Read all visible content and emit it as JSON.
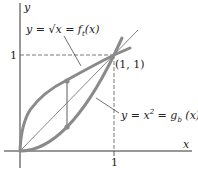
{
  "diagram": {
    "axis_x_label": "x",
    "axis_y_label": "y",
    "tick_x": "1",
    "tick_y": "1",
    "point_label": "(1, 1)",
    "top_curve_label": "y = √x = f",
    "top_curve_sub": "t",
    "top_curve_arg": "(x)",
    "bottom_curve_label": "y = x",
    "bottom_curve_sup": "2",
    "bottom_curve_mid": " = g",
    "bottom_curve_sub": "b",
    "bottom_curve_arg": " (x)"
  },
  "colors": {
    "curve": "#8a8a8a",
    "axis": "#333333",
    "dash": "#555555"
  }
}
